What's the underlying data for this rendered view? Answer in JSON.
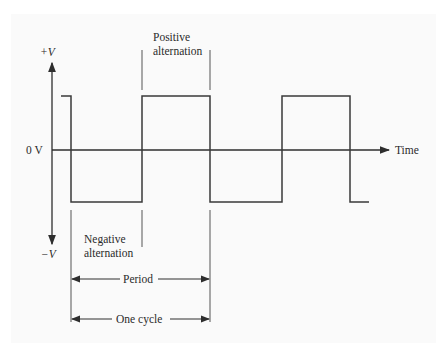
{
  "diagram": {
    "type": "square-wave",
    "axis": {
      "y_positive_label": "+V",
      "y_negative_label": "−V",
      "zero_label": "0 V",
      "x_label": "Time"
    },
    "annotations": {
      "positive_alternation": [
        "Positive",
        "alternation"
      ],
      "negative_alternation": [
        "Negative",
        "alternation"
      ],
      "period": "Period",
      "one_cycle": "One cycle"
    },
    "waveform": {
      "levels": [
        "+V",
        "−V"
      ],
      "transitions_x": [
        61,
        71,
        142,
        210,
        282,
        350,
        369
      ],
      "line_color": "#3a3a3a"
    },
    "colors": {
      "background": "#ffffff",
      "panel": "#fafafa",
      "stroke": "#2e2e2e"
    }
  }
}
